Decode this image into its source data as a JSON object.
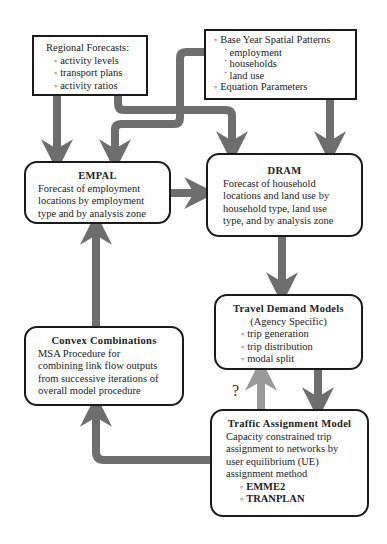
{
  "regional_forecasts": {
    "title": "Regional Forecasts:",
    "items": [
      "activity levels",
      "transport plans",
      "activity ratios"
    ]
  },
  "base_year": {
    "heading": "Base Year Spatial Patterns",
    "sub_items": [
      "employment",
      "households",
      "land use"
    ],
    "second": "Equation Parameters"
  },
  "empal": {
    "title": "EMPAL",
    "lines": [
      "Forecast of employment",
      "locations by employment",
      "type and by analysis zone"
    ]
  },
  "dram": {
    "title": "DRAM",
    "lines": [
      "Forecast of household",
      "locations and land use by",
      "household type, land use",
      "type, and by analysis zone"
    ]
  },
  "travel_demand": {
    "title": "Travel Demand Models",
    "subtitle": "(Agency Specific)",
    "items": [
      "trip generation",
      "trip distribution",
      "modal split"
    ]
  },
  "convex": {
    "title": "Convex Combinations",
    "lines": [
      "MSA Procedure for",
      "combining link flow outputs",
      "from successive iterations of",
      "overall model procedure"
    ]
  },
  "traffic_assignment": {
    "title": "Traffic Assignment Model",
    "lines": [
      "Capacity constrained trip",
      "assignment to networks by",
      "user equilibrium (UE)",
      "assignment method"
    ],
    "items": [
      "EMME2",
      "TRANPLAN"
    ]
  },
  "question_mark": "?",
  "colors": {
    "arrow": "#6e6e6e",
    "arrow_light": "#9a9a9a",
    "border": "#1a1a1a"
  }
}
